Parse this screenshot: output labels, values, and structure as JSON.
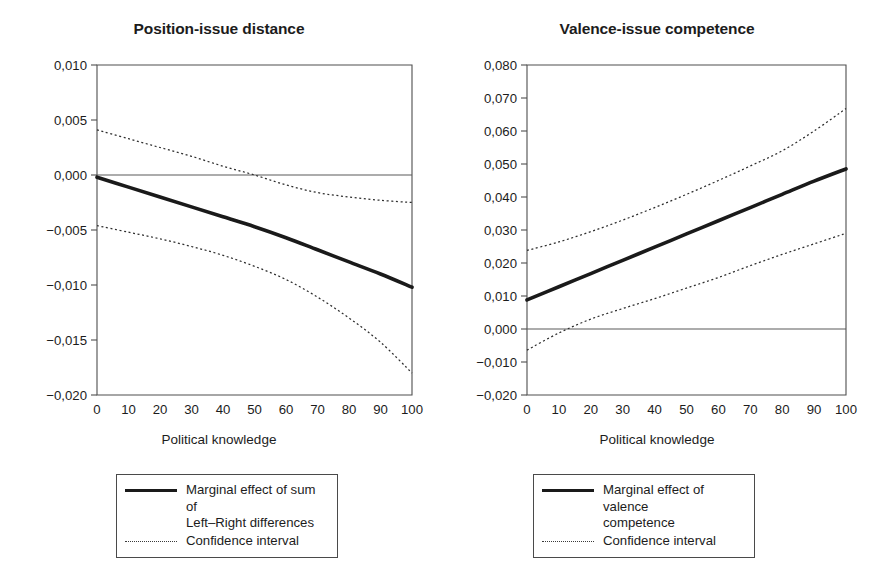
{
  "figure": {
    "background": "#ffffff",
    "line_color": "#1a1a1a",
    "ci_color": "#2e2e2e",
    "axis_color": "#4f4f4f"
  },
  "panels": [
    {
      "id": "position-issue-distance",
      "title": "Position-issue distance",
      "xlabel": "Political knowledge",
      "legend": [
        {
          "key": "solid",
          "label": "Marginal effect of sum of\nLeft–Right differences"
        },
        {
          "key": "dotted",
          "label": "Confidence interval"
        }
      ]
    },
    {
      "id": "valence-issue-competence",
      "title": "Valence-issue competence",
      "xlabel": "Political knowledge",
      "legend": [
        {
          "key": "solid",
          "label": "Marginal effect of valence\ncompetence"
        },
        {
          "key": "dotted",
          "label": "Confidence interval"
        }
      ]
    }
  ],
  "chart_data": [
    {
      "type": "line",
      "title": "Position-issue distance",
      "xlabel": "Political knowledge",
      "ylabel": "",
      "xlim": [
        0,
        100
      ],
      "ylim": [
        -0.02,
        0.01
      ],
      "xticks": [
        0,
        10,
        20,
        30,
        40,
        50,
        60,
        70,
        80,
        90,
        100
      ],
      "xticklabels": [
        "0",
        "10",
        "20",
        "30",
        "40",
        "50",
        "60",
        "70",
        "80",
        "90",
        "100"
      ],
      "yticks": [
        0.01,
        0.005,
        0.0,
        -0.005,
        -0.01,
        -0.015,
        -0.02
      ],
      "yticklabels": [
        "0,010",
        "0,005",
        "0,000",
        "-0,005",
        "-0,010",
        "-0,015",
        "-0,020"
      ],
      "grid": false,
      "zero_line": 0.0,
      "legend_position": "below",
      "x": [
        0,
        10,
        20,
        30,
        40,
        50,
        60,
        70,
        80,
        90,
        100
      ],
      "series": [
        {
          "name": "Marginal effect of sum of Left–Right differences",
          "style": "solid",
          "values": [
            -0.0002,
            -0.0011,
            -0.002,
            -0.0029,
            -0.0038,
            -0.0047,
            -0.0057,
            -0.0068,
            -0.0079,
            -0.009,
            -0.0102
          ]
        },
        {
          "name": "Confidence interval upper",
          "style": "dotted",
          "values": [
            0.0041,
            0.0033,
            0.0025,
            0.0017,
            0.0008,
            0.0,
            -0.0009,
            -0.0016,
            -0.002,
            -0.0023,
            -0.0025
          ]
        },
        {
          "name": "Confidence interval lower",
          "style": "dotted",
          "values": [
            -0.0046,
            -0.0052,
            -0.0058,
            -0.0065,
            -0.0073,
            -0.0083,
            -0.0095,
            -0.0111,
            -0.013,
            -0.0152,
            -0.018
          ]
        }
      ]
    },
    {
      "type": "line",
      "title": "Valence-issue competence",
      "xlabel": "Political knowledge",
      "ylabel": "",
      "xlim": [
        0,
        100
      ],
      "ylim": [
        -0.02,
        0.08
      ],
      "xticks": [
        0,
        10,
        20,
        30,
        40,
        50,
        60,
        70,
        80,
        90,
        100
      ],
      "xticklabels": [
        "0",
        "10",
        "20",
        "30",
        "40",
        "50",
        "60",
        "70",
        "80",
        "90",
        "100"
      ],
      "yticks": [
        0.08,
        0.07,
        0.06,
        0.05,
        0.04,
        0.03,
        0.02,
        0.01,
        0.0,
        -0.01,
        -0.02
      ],
      "yticklabels": [
        "0,080",
        "0,070",
        "0,060",
        "0,050",
        "0,040",
        "0,030",
        "0,020",
        "0,010",
        "0,000",
        "-0,010",
        "-0,020"
      ],
      "grid": false,
      "zero_line": 0.0,
      "legend_position": "below",
      "x": [
        0,
        10,
        20,
        30,
        40,
        50,
        60,
        70,
        80,
        90,
        100
      ],
      "series": [
        {
          "name": "Marginal effect of valence competence",
          "style": "solid",
          "values": [
            0.0088,
            0.0128,
            0.0168,
            0.0208,
            0.0248,
            0.0288,
            0.0328,
            0.0368,
            0.0408,
            0.0448,
            0.0485
          ]
        },
        {
          "name": "Confidence interval upper",
          "style": "dotted",
          "values": [
            0.0238,
            0.0264,
            0.0295,
            0.033,
            0.0368,
            0.0408,
            0.045,
            0.0494,
            0.054,
            0.06,
            0.0668
          ]
        },
        {
          "name": "Confidence interval lower",
          "style": "dotted",
          "values": [
            -0.0064,
            -0.0012,
            0.003,
            0.0062,
            0.0092,
            0.0124,
            0.0156,
            0.0192,
            0.0226,
            0.0258,
            0.029
          ]
        }
      ]
    }
  ]
}
